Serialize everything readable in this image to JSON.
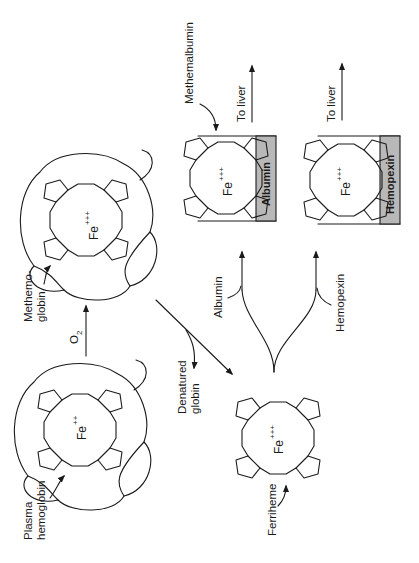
{
  "diagram": {
    "orientation": "rotated-90-ccw",
    "nodes": {
      "plasma_hemoglobin": {
        "label": "Plasma hemoglobin",
        "label_lines": [
          "Plasma",
          "hemoglobin"
        ],
        "ion": "Fe",
        "charge": "++"
      },
      "methemoglobin": {
        "label": "Methemoglobin",
        "label_lines": [
          "Methemo-",
          "globin"
        ],
        "ion": "Fe",
        "charge": "+++"
      },
      "ferriheme": {
        "label": "Ferriheme",
        "ion": "Fe",
        "charge": "+++"
      },
      "denatured_globin": {
        "label_lines": [
          "Denatured",
          "globin"
        ]
      },
      "methemalbumin": {
        "label": "Methemalbumin",
        "ion": "Fe",
        "charge": "+++",
        "carrier": "Albumin"
      },
      "heme_hemopexin": {
        "ion": "Fe",
        "charge": "+++",
        "carrier": "Hemopexin"
      }
    },
    "edges": {
      "oxidation": {
        "label": "O",
        "subscript": "2"
      },
      "albumin_path": {
        "label": "Albumin"
      },
      "hemopexin_path": {
        "label": "Hemopexin"
      },
      "to_liver_1": {
        "label": "To liver"
      },
      "to_liver_2": {
        "label": "To liver"
      }
    },
    "colors": {
      "ink": "#1a1a1a",
      "carrier_fill": "#b8b8b8",
      "background": "#ffffff"
    }
  }
}
